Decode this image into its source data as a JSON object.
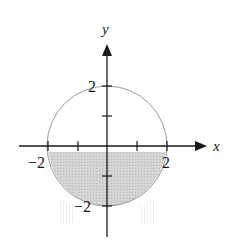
{
  "figure": {
    "type": "graph-region",
    "axes": {
      "x_label": "x",
      "y_label": "y",
      "x_ticks": [
        -2,
        -1,
        1,
        2
      ],
      "y_ticks": [
        2,
        1,
        -1,
        -2
      ],
      "x_tick_labels": [
        "−2",
        "2"
      ],
      "y_tick_labels": [
        "2",
        "−2"
      ]
    },
    "circle": {
      "center": [
        0,
        0
      ],
      "radius": 2,
      "stroke_color": "#9a9a9a"
    },
    "shaded_region": {
      "description": "lower semicircular half-disk, y ≤ 0",
      "fill_color": "#cfcfcf"
    },
    "colors": {
      "axis": "#1a1a1a",
      "circle": "#9a9a9a",
      "shade": "#cfcfcf",
      "background": "#ffffff"
    }
  }
}
